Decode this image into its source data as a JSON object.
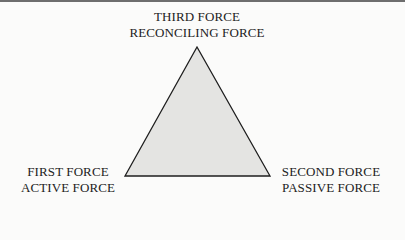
{
  "diagram": {
    "type": "triangle",
    "fill_color": "#e4e4e2",
    "stroke_color": "#1e1e1e",
    "vertices": {
      "top": {
        "line1": "THIRD FORCE",
        "line2": "RECONCILING FORCE"
      },
      "bottom_left": {
        "line1": "FIRST FORCE",
        "line2": "ACTIVE FORCE"
      },
      "bottom_right": {
        "line1": "SECOND FORCE",
        "line2": "PASSIVE FORCE"
      }
    }
  }
}
